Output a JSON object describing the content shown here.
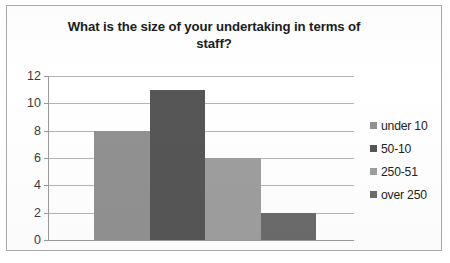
{
  "chart_data": {
    "type": "bar",
    "title": "What is the size of your undertaking in terms of staff?",
    "title_line1": "What is the size of your undertaking in terms of",
    "title_line2": "staff?",
    "xlabel": "",
    "ylabel": "",
    "ylim": [
      0,
      12
    ],
    "ytick_labels": [
      "12",
      "10",
      "8",
      "6",
      "4",
      "2",
      "0"
    ],
    "ytick_values": [
      12,
      10,
      8,
      6,
      4,
      2,
      0
    ],
    "grid": "horizontal",
    "legend_position": "right",
    "categories": [
      "under 10",
      "50-10",
      "250-51",
      "over 250"
    ],
    "values": [
      8,
      11,
      6,
      2
    ],
    "bars": [
      {
        "category": "under 10",
        "value": 8,
        "color": "#919191"
      },
      {
        "category": "50-10",
        "value": 11,
        "color": "#565656"
      },
      {
        "category": "250-51",
        "value": 6,
        "color": "#9e9e9e"
      },
      {
        "category": "over 250",
        "value": 2,
        "color": "#6b6b6b"
      }
    ],
    "legend": [
      {
        "label": "under 10",
        "color": "#919191"
      },
      {
        "label": "50-10",
        "color": "#565656"
      },
      {
        "label": "250-51",
        "color": "#9e9e9e"
      },
      {
        "label": "over 250",
        "color": "#6b6b6b"
      }
    ],
    "colors": {
      "border": "#a8a8a8",
      "gridline": "#b4b4b4",
      "axis": "#9a9a9a",
      "title_text": "#1c1c1c",
      "tick_text": "#3a3a3a",
      "legend_text": "#232323",
      "background": "#ffffff"
    }
  }
}
